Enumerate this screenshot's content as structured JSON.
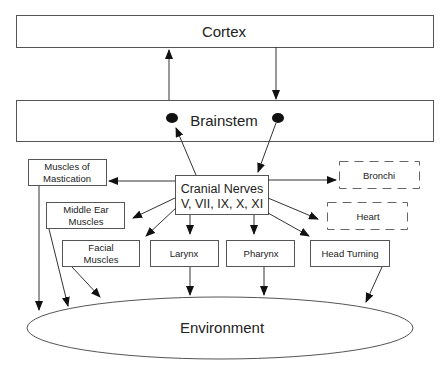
{
  "diagram": {
    "nodes": {
      "cortex": {
        "label": "Cortex"
      },
      "brainstem": {
        "label": "Brainstem"
      },
      "cranial_nerves": {
        "line1": "Cranial Nerves",
        "line2": "V, VII, IX, X, XI"
      },
      "muscles_mastication": {
        "line1": "Muscles of",
        "line2": "Mastication"
      },
      "middle_ear": {
        "line1": "Middle Ear",
        "line2": "Muscles"
      },
      "facial_muscles": {
        "line1": "Facial",
        "line2": "Muscles"
      },
      "larynx": {
        "label": "Larynx"
      },
      "pharynx": {
        "label": "Pharynx"
      },
      "head_turning": {
        "label": "Head Turning"
      },
      "bronchi": {
        "label": "Bronchi",
        "style": "dashed"
      },
      "heart": {
        "label": "Heart",
        "style": "dashed"
      },
      "environment": {
        "label": "Environment",
        "shape": "ellipse"
      }
    },
    "edges": [
      {
        "from": "Brainstem",
        "to": "Cortex"
      },
      {
        "from": "Cortex",
        "to": "Brainstem"
      },
      {
        "from": "Cranial Nerves",
        "to": "Brainstem (left nucleus)"
      },
      {
        "from": "Brainstem (right nucleus)",
        "to": "Cranial Nerves"
      },
      {
        "from": "Cranial Nerves",
        "to": "Muscles of Mastication"
      },
      {
        "from": "Cranial Nerves",
        "to": "Middle Ear Muscles"
      },
      {
        "from": "Cranial Nerves",
        "to": "Facial Muscles"
      },
      {
        "from": "Cranial Nerves",
        "to": "Larynx"
      },
      {
        "from": "Cranial Nerves",
        "to": "Pharynx"
      },
      {
        "from": "Cranial Nerves",
        "to": "Head Turning"
      },
      {
        "from": "Cranial Nerves",
        "to": "Bronchi"
      },
      {
        "from": "Cranial Nerves",
        "to": "Heart"
      },
      {
        "from": "Muscles of Mastication",
        "to": "Environment"
      },
      {
        "from": "Middle Ear Muscles",
        "to": "Environment"
      },
      {
        "from": "Facial Muscles",
        "to": "Environment"
      },
      {
        "from": "Larynx",
        "to": "Environment"
      },
      {
        "from": "Pharynx",
        "to": "Environment"
      },
      {
        "from": "Head Turning",
        "to": "Environment"
      }
    ]
  }
}
